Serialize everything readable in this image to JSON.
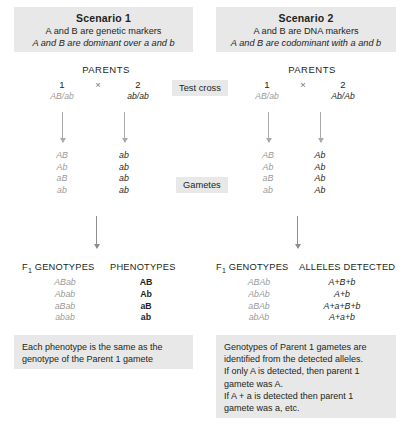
{
  "scenario1": {
    "title": "Scenario 1",
    "line1": "A and B are genetic markers",
    "line2": "A and B are dominant over a and b",
    "parents_label": "PARENTS",
    "parent1_num": "1",
    "cross_symbol": "×",
    "parent2_num": "2",
    "parent1_genotype": "AB/ab",
    "parent2_genotype": "ab/ab",
    "gametes_p1": [
      "AB",
      "Ab",
      "aB",
      "ab"
    ],
    "gametes_p2": [
      "ab",
      "ab",
      "ab",
      "ab"
    ],
    "f1_header": "F1 GENOTYPES",
    "pheno_header": "PHENOTYPES",
    "f1_genotypes": [
      "ABab",
      "Abab",
      "aBab",
      "abab"
    ],
    "phenotypes": [
      "AB",
      "Ab",
      "aB",
      "ab"
    ],
    "note": [
      "Each phenotype is the same as the",
      "genotype of the Parent 1 gamete"
    ]
  },
  "scenario2": {
    "title": "Scenario 2",
    "line1": "A and B are DNA markers",
    "line2": "A and B are codominant with a and b",
    "parents_label": "PARENTS",
    "parent1_num": "1",
    "cross_symbol": "×",
    "parent2_num": "2",
    "parent1_genotype": "AB/ab",
    "parent2_genotype": "Ab/Ab",
    "gametes_p1": [
      "AB",
      "Ab",
      "aB",
      "ab"
    ],
    "gametes_p2": [
      "Ab",
      "Ab",
      "Ab",
      "Ab"
    ],
    "f1_header": "F1 GENOTYPES",
    "alleles_header": "ALLELES DETECTED",
    "f1_genotypes": [
      "ABAb",
      "AbAb",
      "aBAb",
      "abAb"
    ],
    "alleles_detected": [
      "A+B+b",
      "A+b",
      "A+a+B+b",
      "A+a+b"
    ],
    "note": [
      "Genotypes of Parent 1 gametes are",
      "identified from the detected alleles.",
      "If only A is detected, then parent 1",
      "gamete was A.",
      "If A + a is detected then parent 1",
      "gamete was a, etc."
    ]
  },
  "middle": {
    "test_cross": "Test cross",
    "gametes": "Gametes"
  },
  "colors": {
    "box_background": "#e8e8e8",
    "text": "#231f20",
    "muted_text": "#9a9a9a",
    "arrow": "#aaaaaa"
  }
}
